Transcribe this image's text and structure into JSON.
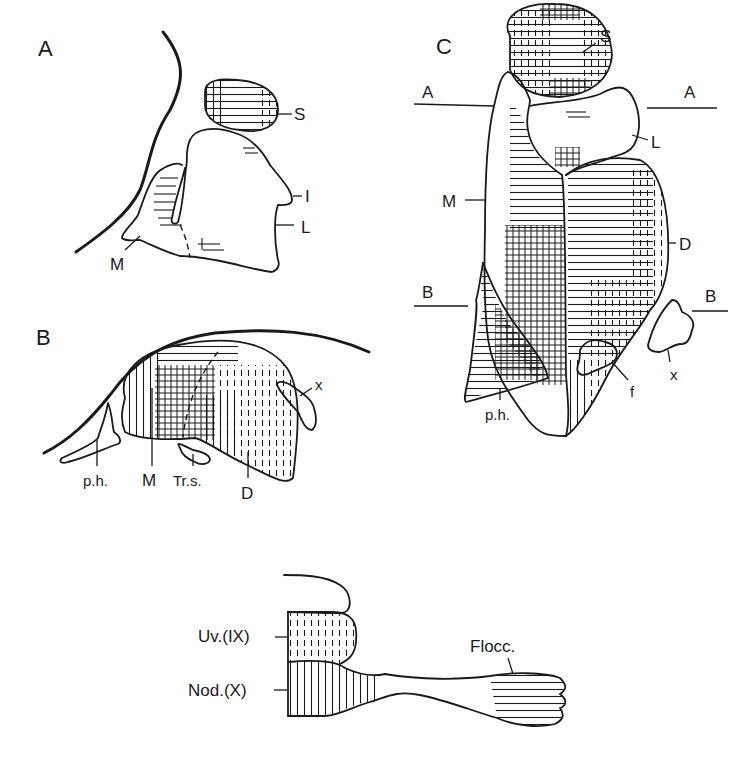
{
  "figure": {
    "panels": [
      {
        "id": "A",
        "label": "A",
        "parts": {
          "S": "S",
          "I": "I",
          "L": "L",
          "M": "M"
        }
      },
      {
        "id": "B",
        "label": "B",
        "parts": {
          "x": "x",
          "ph": "p.h.",
          "M": "M",
          "Trs": "Tr.s.",
          "D": "D"
        }
      },
      {
        "id": "C",
        "label": "C",
        "parts": {
          "S": "S",
          "L": "L",
          "M": "M",
          "D": "D",
          "ph": "p.h.",
          "f": "f",
          "x": "x"
        },
        "section_lines": {
          "A_left": "A",
          "A_right": "A",
          "B_left": "B",
          "B_right": "B"
        }
      },
      {
        "id": "D",
        "label": "",
        "parts": {
          "uv": "Uv.(IX)",
          "nod": "Nod.(X)",
          "flocc": "Flocc."
        }
      }
    ],
    "hatching": {
      "horizontal": "horizontal-lines",
      "vertical": "vertical-lines",
      "dashed_vertical": "dashed-vertical-lines",
      "crosshatch": "crosshatch"
    },
    "colors": {
      "ink": "#1a1a1a",
      "paper": "#ffffff"
    }
  }
}
